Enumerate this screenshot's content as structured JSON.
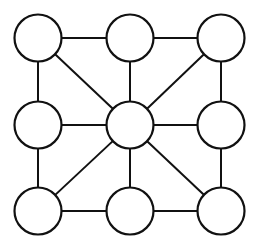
{
  "figure": {
    "background_color": "#ffffff",
    "stroke_color": "#111111",
    "node_fill_color": "#ffffff",
    "node_stroke_width": 2.2,
    "edge_stroke_width": 2,
    "width": 255,
    "height": 248
  },
  "chart_data": {
    "type": "diagram",
    "title": "",
    "graph_kind": "undirected node-link graph",
    "node_count": 9,
    "edge_count": 16,
    "node_radius": 23.5,
    "nodes": [
      {
        "id": "top-left",
        "label": "",
        "x": 38,
        "y": 38,
        "row": 0,
        "col": 0,
        "degree": 3
      },
      {
        "id": "top-center",
        "label": "",
        "x": 130,
        "y": 38,
        "row": 0,
        "col": 1,
        "degree": 3
      },
      {
        "id": "top-right",
        "label": "",
        "x": 221,
        "y": 38,
        "row": 0,
        "col": 2,
        "degree": 3
      },
      {
        "id": "middle-left",
        "label": "",
        "x": 38,
        "y": 125,
        "row": 1,
        "col": 0,
        "degree": 3
      },
      {
        "id": "center",
        "label": "",
        "x": 130,
        "y": 125,
        "row": 1,
        "col": 1,
        "degree": 8
      },
      {
        "id": "middle-right",
        "label": "",
        "x": 221,
        "y": 125,
        "row": 1,
        "col": 2,
        "degree": 3
      },
      {
        "id": "bottom-left",
        "label": "",
        "x": 38,
        "y": 211,
        "row": 2,
        "col": 0,
        "degree": 3
      },
      {
        "id": "bottom-center",
        "label": "",
        "x": 130,
        "y": 211,
        "row": 2,
        "col": 1,
        "degree": 3
      },
      {
        "id": "bottom-right",
        "label": "",
        "x": 221,
        "y": 211,
        "row": 2,
        "col": 2,
        "degree": 3
      }
    ],
    "edges": [
      {
        "source": "top-left",
        "target": "top-center",
        "kind": "horizontal"
      },
      {
        "source": "top-center",
        "target": "top-right",
        "kind": "horizontal"
      },
      {
        "source": "middle-left",
        "target": "center",
        "kind": "horizontal"
      },
      {
        "source": "center",
        "target": "middle-right",
        "kind": "horizontal"
      },
      {
        "source": "bottom-left",
        "target": "bottom-center",
        "kind": "horizontal"
      },
      {
        "source": "bottom-center",
        "target": "bottom-right",
        "kind": "horizontal"
      },
      {
        "source": "top-left",
        "target": "middle-left",
        "kind": "vertical"
      },
      {
        "source": "middle-left",
        "target": "bottom-left",
        "kind": "vertical"
      },
      {
        "source": "top-center",
        "target": "center",
        "kind": "vertical"
      },
      {
        "source": "center",
        "target": "bottom-center",
        "kind": "vertical"
      },
      {
        "source": "top-right",
        "target": "middle-right",
        "kind": "vertical"
      },
      {
        "source": "middle-right",
        "target": "bottom-right",
        "kind": "vertical"
      },
      {
        "source": "top-left",
        "target": "center",
        "kind": "diagonal"
      },
      {
        "source": "top-right",
        "target": "center",
        "kind": "diagonal"
      },
      {
        "source": "bottom-left",
        "target": "center",
        "kind": "diagonal"
      },
      {
        "source": "bottom-right",
        "target": "center",
        "kind": "diagonal"
      }
    ]
  }
}
